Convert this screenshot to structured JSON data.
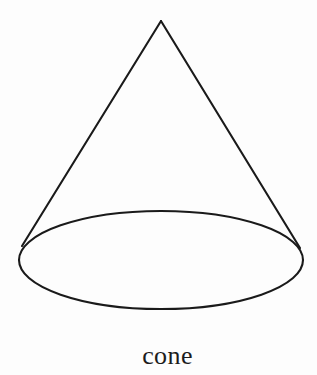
{
  "figure": {
    "caption": "cone",
    "shape_name": "cone",
    "kind": "line-art-geometric-diagram",
    "background_color": "#fdfdfd",
    "stroke_color": "#1a1a1a",
    "stroke_width": 2.1,
    "canvas": {
      "width": 317,
      "height": 375
    },
    "geometry": {
      "apex": {
        "x": 161,
        "y": 21
      },
      "base_ellipse": {
        "center_x": 161,
        "center_y": 260,
        "radius_x": 142,
        "radius_y": 49
      },
      "left_tangent": {
        "x": 22,
        "y": 246
      },
      "right_tangent": {
        "x": 300,
        "y": 248
      }
    },
    "elements": [
      {
        "name": "apex-point",
        "label": "apex"
      },
      {
        "name": "left-slant-line",
        "label": "left slant edge"
      },
      {
        "name": "right-slant-line",
        "label": "right slant edge"
      },
      {
        "name": "base-ellipse",
        "label": "circular base (drawn as ellipse)"
      }
    ]
  }
}
